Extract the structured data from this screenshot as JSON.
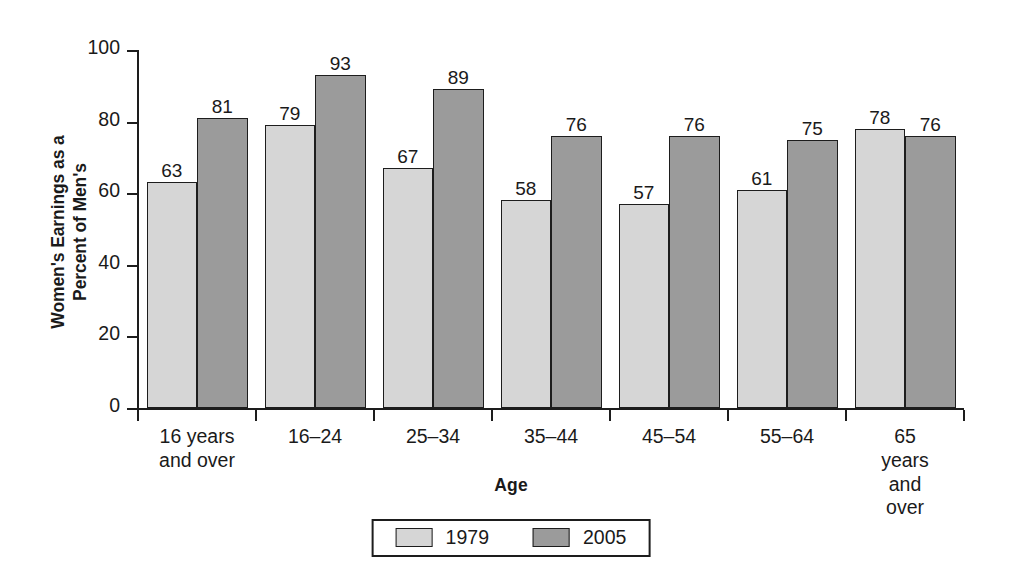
{
  "chart_data": {
    "type": "bar",
    "title": "",
    "subtitle": "",
    "xlabel": "Age",
    "ylabel_lines": [
      "Women's Earnings as a",
      "Percent of Men's"
    ],
    "ylabel": "Women's Earnings as a Percent of Men's",
    "ylim": [
      0,
      100
    ],
    "yticks": [
      0,
      20,
      40,
      60,
      80,
      100
    ],
    "ytick_labels": [
      "0",
      "20",
      "40",
      "60",
      "80",
      "100"
    ],
    "grid": false,
    "legend_position": "bottom-center",
    "categories": [
      "16 years\nand over",
      "16–24",
      "25–34",
      "35–44",
      "45–54",
      "55–64",
      "65 years\nand over"
    ],
    "series": [
      {
        "name": "1979",
        "color": "#d6d6d6",
        "values": [
          63,
          79,
          67,
          58,
          57,
          61,
          78
        ]
      },
      {
        "name": "2005",
        "color": "#9b9b9b",
        "values": [
          81,
          93,
          89,
          76,
          76,
          75,
          76
        ]
      }
    ],
    "annotations": []
  },
  "legend": {
    "entries": [
      {
        "label": "1979",
        "swatch": "light-gray"
      },
      {
        "label": "2005",
        "swatch": "dark-gray"
      }
    ]
  },
  "axes": {
    "x_title": "Age",
    "y_title_line1": "Women's Earnings as a",
    "y_title_line2": "Percent of Men's"
  }
}
